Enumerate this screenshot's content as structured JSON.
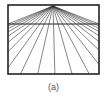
{
  "figure": {
    "caption": "(a)",
    "frame": {
      "x": 8,
      "y": 5,
      "width": 91,
      "height": 69
    },
    "horizon_y": 24,
    "vanishing_point": {
      "x": 53,
      "y": 6
    },
    "ray_count": 21,
    "colors": {
      "frame": "#222222",
      "rays": "#333333",
      "caption": "#555555"
    }
  }
}
